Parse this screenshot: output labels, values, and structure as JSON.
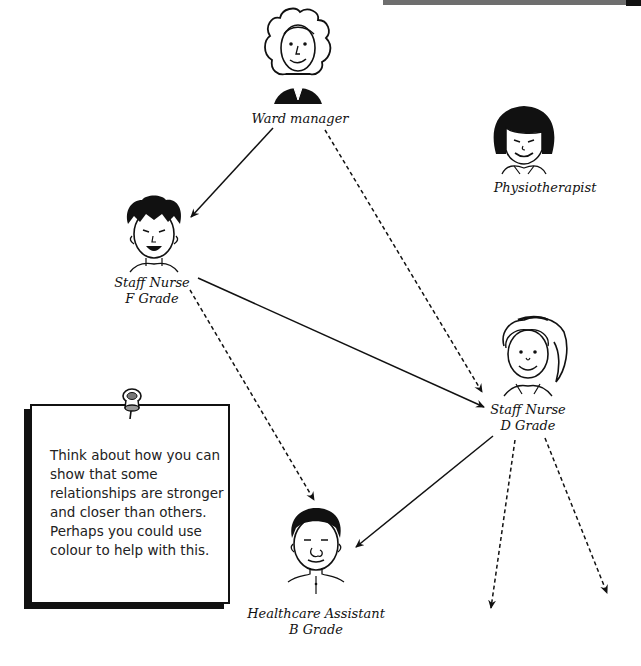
{
  "diagram": {
    "type": "relationship-map",
    "nodes": [
      {
        "id": "ward-manager",
        "label_lines": [
          "Ward manager"
        ],
        "icon": "person-curly-hair-icon"
      },
      {
        "id": "physiotherapist",
        "label_lines": [
          "Physiotherapist"
        ],
        "icon": "person-bob-hair-icon"
      },
      {
        "id": "staff-nurse-f",
        "label_lines": [
          "Staff Nurse",
          "F Grade"
        ],
        "icon": "person-spiky-hair-icon"
      },
      {
        "id": "staff-nurse-d",
        "label_lines": [
          "Staff Nurse",
          "D Grade"
        ],
        "icon": "person-nurse-cap-icon"
      },
      {
        "id": "healthcare-assistant",
        "label_lines": [
          "Healthcare Assistant",
          "B Grade"
        ],
        "icon": "person-short-hair-icon"
      }
    ],
    "edges": [
      {
        "from": "ward-manager",
        "to": "staff-nurse-f",
        "style": "solid"
      },
      {
        "from": "ward-manager",
        "to": "staff-nurse-d",
        "style": "dashed"
      },
      {
        "from": "staff-nurse-f",
        "to": "staff-nurse-d",
        "style": "solid"
      },
      {
        "from": "staff-nurse-f",
        "to": "healthcare-assistant",
        "style": "dashed"
      },
      {
        "from": "staff-nurse-d",
        "to": "healthcare-assistant",
        "style": "solid"
      },
      {
        "from": "staff-nurse-d",
        "to": "offscreen-1",
        "style": "dashed"
      },
      {
        "from": "staff-nurse-d",
        "to": "offscreen-2",
        "style": "dashed"
      }
    ]
  },
  "labels": {
    "ward_manager": "Ward manager",
    "physiotherapist": "Physiotherapist",
    "staff_f_line1": "Staff Nurse",
    "staff_f_line2": "F Grade",
    "staff_d_line1": "Staff Nurse",
    "staff_d_line2": "D Grade",
    "hca_line1": "Healthcare Assistant",
    "hca_line2": "B Grade"
  },
  "note": {
    "icon": "thumbtack-icon",
    "text": "Think about how you can show that some relationships are stronger and closer than others. Perhaps you could use colour to help with this."
  },
  "colors": {
    "ink": "#111111",
    "background": "#ffffff",
    "topbar": "#6e6e6e"
  }
}
